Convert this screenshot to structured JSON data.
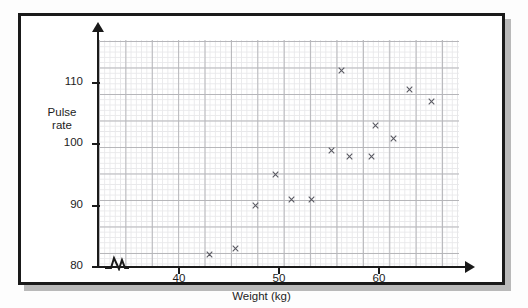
{
  "figure": {
    "name": "scatter-graph-pulse-rate-vs-weight"
  },
  "chart_data": {
    "type": "scatter",
    "title": "",
    "xlabel": "Weight (kg)",
    "ylabel": "Pulse rate",
    "ylabel_lines": [
      "Pulse",
      "rate"
    ],
    "xlim": [
      32,
      68
    ],
    "ylim": [
      80,
      117
    ],
    "xticks": [
      40,
      50,
      60
    ],
    "yticks": [
      80,
      90,
      100,
      110
    ],
    "xtick_labels": [
      "40",
      "50",
      "60"
    ],
    "ytick_labels": [
      "80",
      "90",
      "100",
      "110"
    ],
    "grid": true,
    "grid_major_step_x": 2,
    "grid_major_step_y": 5,
    "grid_minor_step_x": 0.4,
    "grid_minor_step_y": 1,
    "y_axis_break": false,
    "x_axis_break": true,
    "marker": "x",
    "marker_color": "#5a5a62",
    "legend": "none",
    "points": [
      {
        "x": 43.0,
        "y": 82
      },
      {
        "x": 45.6,
        "y": 83
      },
      {
        "x": 47.6,
        "y": 90
      },
      {
        "x": 49.6,
        "y": 95
      },
      {
        "x": 51.2,
        "y": 91
      },
      {
        "x": 53.2,
        "y": 91
      },
      {
        "x": 55.2,
        "y": 99
      },
      {
        "x": 56.2,
        "y": 112
      },
      {
        "x": 57.0,
        "y": 98
      },
      {
        "x": 59.2,
        "y": 98
      },
      {
        "x": 59.6,
        "y": 103
      },
      {
        "x": 61.4,
        "y": 101
      },
      {
        "x": 63.0,
        "y": 109
      },
      {
        "x": 65.2,
        "y": 107
      }
    ]
  },
  "colors": {
    "frame": "#1a1a1a",
    "grid_major": "#b6b6ba",
    "grid_minor": "#e8e8ea",
    "marker": "#5a5a62",
    "background": "#ffffff"
  }
}
